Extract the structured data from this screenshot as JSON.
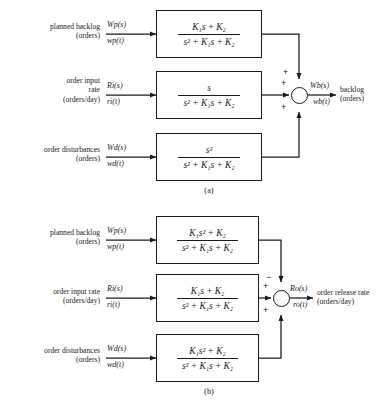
{
  "figure": {
    "caption_a": "(a)",
    "caption_b": "(b)",
    "denominator": "s² + K₁s + K₂"
  },
  "diagram_a": {
    "inputs": [
      {
        "description_line1": "planned backlog",
        "description_line2": "(orders)",
        "laplace": "Wp(s)",
        "time": "wp(t)",
        "block_numerator": "K₁s + K₂",
        "block_denominator": "s² + K₁s + K₂",
        "sign": "+"
      },
      {
        "description_line1": "order input",
        "description_line2": "rate",
        "description_line3": "(orders/day)",
        "laplace": "Ri(s)",
        "time": "ri(t)",
        "block_numerator": "s",
        "block_denominator": "s² + K₁s + K₂",
        "sign": "+"
      },
      {
        "description_line1": "order disturbances",
        "description_line2": "(orders)",
        "laplace": "Wd(s)",
        "time": "wd(t)",
        "block_numerator": "s²",
        "block_denominator": "s² + K₁s + K₂",
        "sign": "+"
      }
    ],
    "output": {
      "laplace": "Wb(s)",
      "time": "wb(t)",
      "description_line1": "backlog",
      "description_line2": "(orders)"
    }
  },
  "diagram_b": {
    "inputs": [
      {
        "description_line1": "planned backlog",
        "description_line2": "(orders)",
        "laplace": "Wp(s)",
        "time": "wp(t)",
        "block_numerator": "K₁s² + K₂",
        "block_denominator": "s² + K₁s + K₂",
        "sign": "−"
      },
      {
        "description_line1": "order input rate",
        "description_line2": "(orders/day)",
        "laplace": "Ri(s)",
        "time": "ri(t)",
        "block_numerator": "K₁s + K₂",
        "block_denominator": "s² + K₁s + K₂",
        "sign": "+"
      },
      {
        "description_line1": "order disturbances",
        "description_line2": "(orders)",
        "laplace": "Wd(s)",
        "time": "wd(t)",
        "block_numerator": "K₁s² + K₂",
        "block_denominator": "s² + K₁s + K₂",
        "sign": "+"
      }
    ],
    "output": {
      "laplace": "Ro(s)",
      "time": "ro(t)",
      "description_line1": "order release rate",
      "description_line2": "(orders/day)"
    }
  }
}
